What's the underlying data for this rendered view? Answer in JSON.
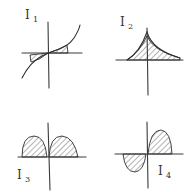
{
  "figure": {
    "panels": [
      {
        "label": "I",
        "subscript": "1",
        "shape": "odd increasing curve, shaded symmetric regions above and below axis"
      },
      {
        "label": "I",
        "subscript": "2",
        "shape": "cusp peak at origin decaying both sides, shaded above axis"
      },
      {
        "label": "I",
        "subscript": "3",
        "shape": "two positive humps on either side of origin, shaded"
      },
      {
        "label": "I",
        "subscript": "4",
        "shape": "odd sine-like wave, negative hump left, positive hump right, shaded"
      }
    ],
    "colors": {
      "ink": "#333333",
      "background": "#ffffff"
    }
  }
}
